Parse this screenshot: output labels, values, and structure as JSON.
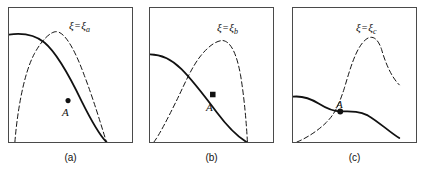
{
  "figure": {
    "title": "",
    "background_color": "#ffffff",
    "stroke_color": "#111111",
    "border_color": "#4a4a4a"
  },
  "panels": [
    {
      "id": "a",
      "caption": "(a)",
      "annotation": {
        "symbol": "ξ",
        "equals": "=",
        "value_symbol": "ξ",
        "subscript": "a",
        "full": "ξ=ξₐ"
      },
      "marker": {
        "label": "A",
        "shape": "dot",
        "x": 60,
        "y": 94
      },
      "solid_curve": "M 0,27 C 14,25 26,27 36,35 C 48,45 62,70 74,95 C 86,119 94,131 99,136",
      "dashed_curve": "M 6,136 C 8,110 14,68 26,46 C 33,33 42,24 48,24 C 56,24 66,40 76,67 C 86,93 94,120 99,136"
    },
    {
      "id": "b",
      "caption": "(b)",
      "annotation": {
        "symbol": "ξ",
        "equals": "=",
        "value_symbol": "ξ",
        "subscript": "b",
        "full": "ξ=ξᵇ"
      },
      "marker": {
        "label": "A",
        "shape": "square",
        "x": 61,
        "y": 88
      },
      "solid_curve": "M 0,47 C 12,47 22,52 32,62 C 44,74 56,90 68,106 C 80,122 90,131 98,136",
      "dashed_curve": "M 4,136 C 10,128 18,112 26,96 C 34,80 42,60 52,48 C 60,38 68,33 74,33 C 82,34 88,46 92,68 C 96,92 98,118 99,136"
    },
    {
      "id": "c",
      "caption": "(c)",
      "annotation": {
        "symbol": "ξ",
        "equals": "=",
        "value_symbol": "ξ",
        "subscript": "c",
        "full": "ξ=ξᶜ"
      },
      "marker": {
        "label": "A",
        "shape": "dot",
        "x": 48,
        "y": 104
      },
      "solid_curve": "M 0,90 C 10,89 18,92 26,97 C 34,102 40,105 48,105 C 58,105 66,104 76,109 C 88,116 98,126 108,132",
      "dashed_curve": "M 4,136 C 14,132 26,124 34,116 C 42,108 46,100 52,82 C 58,62 64,40 74,32 C 80,27 86,30 90,42 C 94,56 100,70 108,78"
    }
  ]
}
